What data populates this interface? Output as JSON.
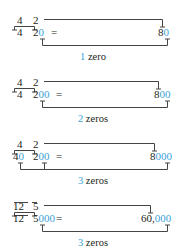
{
  "accent_color": "#3a9fd8",
  "examples": [
    {
      "top": {
        "a": "4",
        "b": "2"
      },
      "bottom": {
        "a_black": "4",
        "a_blue": "",
        "b_black": "2",
        "b_blue": "0",
        "equals": "="
      },
      "result": {
        "black": "8",
        "blue": "0"
      },
      "label": {
        "count": "1",
        "text": " zero"
      }
    },
    {
      "top": {
        "a": "4",
        "b": "2"
      },
      "bottom": {
        "a_black": "4",
        "a_blue": "",
        "b_black": "2",
        "b_blue": "00",
        "equals": "="
      },
      "result": {
        "black": "8",
        "blue": "00"
      },
      "label": {
        "count": "2",
        "text": " zeros"
      }
    },
    {
      "top": {
        "a": "4",
        "b": "2"
      },
      "bottom": {
        "a_black": "4",
        "a_blue": "0",
        "b_black": "2",
        "b_blue": "00",
        "equals": "="
      },
      "result": {
        "black": "8",
        "blue": "000"
      },
      "label": {
        "count": "3",
        "text": " zeros"
      }
    },
    {
      "top": {
        "a": "12",
        "b": "5"
      },
      "bottom": {
        "a_black": "12",
        "a_blue": "",
        "b_black": "5",
        "b_blue": "000",
        "equals": "="
      },
      "result": {
        "black": "60,",
        "blue": "000"
      },
      "label": {
        "count": "3",
        "text": " zeros"
      }
    }
  ]
}
